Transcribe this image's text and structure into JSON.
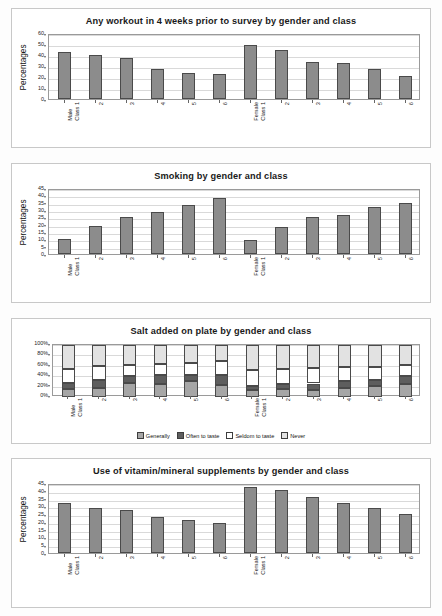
{
  "page": {
    "background": "#fdfdfd",
    "bar_color": "#8c8c8c",
    "bar_border": "#4a4a4a"
  },
  "common": {
    "ylabel": "Percentages",
    "categories": [
      {
        "l1": "Male",
        "l2": "Class 1"
      },
      {
        "l1": "2",
        "l2": ""
      },
      {
        "l1": "3",
        "l2": ""
      },
      {
        "l1": "4",
        "l2": ""
      },
      {
        "l1": "5",
        "l2": ""
      },
      {
        "l1": "6",
        "l2": ""
      },
      {
        "l1": "Female",
        "l2": "Class 1"
      },
      {
        "l1": "2",
        "l2": ""
      },
      {
        "l1": "3",
        "l2": ""
      },
      {
        "l1": "4",
        "l2": ""
      },
      {
        "l1": "5",
        "l2": ""
      },
      {
        "l1": "6",
        "l2": ""
      }
    ]
  },
  "charts": [
    {
      "id": "workout",
      "title": "Any workout in 4 weeks prior to survey by gender and class"
    },
    {
      "id": "smoking",
      "title": "Smoking by gender and class"
    },
    {
      "id": "salt",
      "title": "Salt added on plate by gender and class"
    },
    {
      "id": "supplements",
      "title": "Use of vitamin/mineral supplements by gender and class"
    }
  ],
  "legend": {
    "items": [
      {
        "label": "Generally",
        "swatch": "#a6a6a6"
      },
      {
        "label": "Often to taste",
        "swatch": "#5e5e5e"
      },
      {
        "label": "Seldom to taste",
        "swatch": "#ffffff"
      },
      {
        "label": "Never",
        "swatch": "#e2e2e2"
      }
    ]
  },
  "chart_data": [
    {
      "type": "bar",
      "title": "Any workout in 4 weeks prior to survey by gender and class",
      "xlabel": "",
      "ylabel": "Percentages",
      "ylim": [
        0,
        60
      ],
      "yticks": [
        0,
        10,
        20,
        30,
        40,
        50,
        60
      ],
      "ticklabels": [
        "0",
        "10",
        "20",
        "30",
        "40",
        "50",
        "60"
      ],
      "grid": true,
      "legend": "none",
      "categories": [
        "Male Class 1",
        "2",
        "3",
        "4",
        "5",
        "6",
        "Female Class 1",
        "2",
        "3",
        "4",
        "5",
        "6"
      ],
      "values": [
        43,
        40,
        37.5,
        27.5,
        24,
        22.5,
        49,
        44.5,
        34,
        32.5,
        27,
        21
      ]
    },
    {
      "type": "bar",
      "title": "Smoking by gender and class",
      "xlabel": "",
      "ylabel": "Percentages",
      "ylim": [
        0,
        45
      ],
      "yticks": [
        0,
        5,
        10,
        15,
        20,
        25,
        30,
        35,
        40,
        45
      ],
      "ticklabels": [
        "0",
        "5",
        "10",
        "15",
        "20",
        "25",
        "30",
        "35",
        "40",
        "45"
      ],
      "grid": true,
      "legend": "none",
      "categories": [
        "Male Class 1",
        "2",
        "3",
        "4",
        "5",
        "6",
        "Female Class 1",
        "2",
        "3",
        "4",
        "5",
        "6"
      ],
      "values": [
        10,
        19,
        25.5,
        28.5,
        33.5,
        38.5,
        9.5,
        18.5,
        25,
        26.5,
        32,
        34.5
      ]
    },
    {
      "type": "bar",
      "subtype": "stacked-100",
      "title": "Salt added on plate by gender and class",
      "xlabel": "",
      "ylabel": "",
      "ylim": [
        0,
        100
      ],
      "yticks": [
        0,
        20,
        40,
        60,
        80,
        100
      ],
      "ticklabels": [
        "0%",
        "20%",
        "40%",
        "60%",
        "80%",
        "100%"
      ],
      "grid": true,
      "legend": "bottom-center",
      "categories": [
        "Male Class 1",
        "2",
        "3",
        "4",
        "5",
        "6",
        "Female Class 1",
        "2",
        "3",
        "4",
        "5",
        "6"
      ],
      "series": [
        {
          "name": "Generally",
          "values": [
            15,
            18,
            26,
            25,
            30,
            23,
            13,
            15,
            14,
            18,
            21,
            25
          ]
        },
        {
          "name": "Often to taste",
          "values": [
            12,
            14,
            14,
            17,
            13,
            20,
            9,
            10,
            12,
            12,
            12,
            15
          ]
        },
        {
          "name": "Seldom to taste",
          "values": [
            27,
            28,
            22,
            21,
            22,
            27,
            29,
            28,
            29,
            27,
            24,
            22
          ]
        },
        {
          "name": "Never",
          "values": [
            46,
            40,
            38,
            37,
            35,
            30,
            49,
            47,
            45,
            43,
            43,
            38
          ]
        }
      ]
    },
    {
      "type": "bar",
      "title": "Use of vitamin/mineral supplements by gender and class",
      "xlabel": "",
      "ylabel": "Percentages",
      "ylim": [
        0,
        45
      ],
      "yticks": [
        0,
        5,
        10,
        15,
        20,
        25,
        30,
        35,
        40,
        45
      ],
      "ticklabels": [
        "0",
        "5",
        "10",
        "15",
        "20",
        "25",
        "30",
        "35",
        "40",
        "45"
      ],
      "grid": true,
      "legend": "none",
      "categories": [
        "Male Class 1",
        "2",
        "3",
        "4",
        "5",
        "6",
        "Female Class 1",
        "2",
        "3",
        "4",
        "5",
        "6"
      ],
      "values": [
        32,
        29,
        27.5,
        23,
        21.5,
        19,
        42.5,
        40.5,
        36,
        32,
        29,
        25
      ]
    }
  ]
}
